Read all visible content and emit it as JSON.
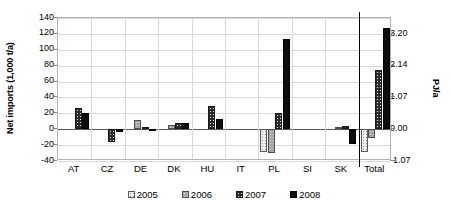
{
  "chart_data": {
    "type": "bar",
    "title": "",
    "xlabel": "",
    "ylabel": "Net imports (1,000 t/a)",
    "y2label": "PJ/a",
    "categories": [
      "AT",
      "CZ",
      "DE",
      "DK",
      "HU",
      "IT",
      "PL",
      "SI",
      "SK",
      "Total"
    ],
    "series": [
      {
        "name": "2005",
        "values": [
          null,
          null,
          null,
          null,
          null,
          null,
          -29,
          null,
          null,
          -29
        ]
      },
      {
        "name": "2006",
        "values": [
          null,
          null,
          11,
          5,
          null,
          null,
          -30,
          null,
          3,
          -11
        ]
      },
      {
        "name": "2007",
        "values": [
          27,
          -16,
          3,
          8,
          29,
          null,
          21,
          null,
          4,
          75
        ]
      },
      {
        "name": "2008",
        "values": [
          21,
          -4,
          -2,
          8,
          13,
          null,
          114,
          null,
          -18,
          128
        ]
      }
    ],
    "ylim": [
      -40,
      140
    ],
    "yticks": [
      140,
      120,
      100,
      80,
      60,
      40,
      20,
      0,
      -20,
      -40
    ],
    "ytick_labels": [
      "140",
      "120",
      "100",
      "80",
      "60",
      "40",
      "20",
      "0",
      "-20",
      "-40"
    ],
    "y2lim": [
      -1.07,
      3.74
    ],
    "y2ticks": [
      3.2,
      2.14,
      1.07,
      0.0,
      -1.07
    ],
    "y2tick_labels": [
      "3.20",
      "2.14",
      "1.07",
      "0.00",
      "-1.07"
    ],
    "grid": true,
    "legend_position": "bottom",
    "legend": [
      "2005",
      "2006",
      "2007",
      "2008"
    ],
    "series_colors": [
      "#ededed",
      "#a6a6a6",
      "#2b2b2b",
      "#0d0d0d"
    ],
    "annotations": {
      "total_separator": "vertical line before Total group"
    }
  }
}
